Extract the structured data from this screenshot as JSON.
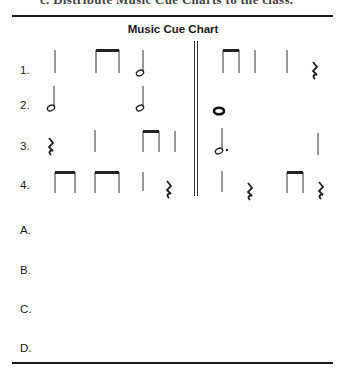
{
  "header_cut_text": "c. Distribute Music Cue Charts to the class.",
  "chart": {
    "title": "Music Cue Chart",
    "rows": [
      {
        "label": "1.",
        "left": [
          "quarter",
          "eighth-pair",
          "half"
        ],
        "right": [
          "eighth-pair",
          "quarter",
          "quarter",
          "quarter-rest"
        ]
      },
      {
        "label": "2.",
        "left": [
          "half",
          "half"
        ],
        "right": [
          "whole"
        ]
      },
      {
        "label": "3.",
        "left": [
          "quarter-rest",
          "quarter",
          "eighth-pair",
          "quarter"
        ],
        "right": [
          "dotted-half",
          "quarter"
        ]
      },
      {
        "label": "4.",
        "left": [
          "eighth-pair",
          "eighth-pair",
          "quarter",
          "quarter-rest"
        ],
        "right": [
          "quarter",
          "quarter-rest",
          "eighth-pair",
          "quarter-rest"
        ]
      }
    ],
    "answer_rows": [
      {
        "label": "A."
      },
      {
        "label": "B."
      },
      {
        "label": "C."
      },
      {
        "label": "D."
      }
    ]
  }
}
